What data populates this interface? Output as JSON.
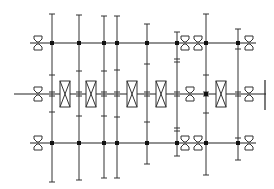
{
  "diagram": {
    "type": "gear-transmission-schematic",
    "stroke_color": "#333333",
    "background": "#ffffff",
    "shafts": [
      {
        "id": "top-shaft",
        "y": 43,
        "x1": 30,
        "x2": 256
      },
      {
        "id": "middle-shaft",
        "y": 94,
        "x1": 14,
        "x2": 266
      },
      {
        "id": "bottom-shaft",
        "y": 143,
        "x1": 30,
        "x2": 256
      }
    ],
    "output_bar": {
      "x": 265,
      "y1": 80,
      "y2": 110
    },
    "gears": [
      {
        "x": 52,
        "y1": 14,
        "y2": 182,
        "ticks": [
          75,
          112
        ]
      },
      {
        "x": 79,
        "y1": 15,
        "y2": 180,
        "ticks": [
          71,
          116
        ]
      },
      {
        "x": 104,
        "y1": 16,
        "y2": 178,
        "ticks": [
          71,
          116
        ]
      },
      {
        "x": 117,
        "y1": 16,
        "y2": 178,
        "ticks": [
          70,
          117
        ]
      },
      {
        "x": 147,
        "y1": 24,
        "y2": 164,
        "ticks": [
          64,
          122
        ]
      },
      {
        "x": 177,
        "y1": 32,
        "y2": 156,
        "ticks": [
          59,
          62,
          128,
          131
        ]
      },
      {
        "x": 206,
        "y1": 14,
        "y2": 175,
        "ticks": [
          75,
          113
        ]
      },
      {
        "x": 238,
        "y1": 29,
        "y2": 160,
        "ticks": [
          49,
          138
        ]
      }
    ],
    "nodes": [
      {
        "x": 52,
        "y": 43
      },
      {
        "x": 79,
        "y": 43
      },
      {
        "x": 104,
        "y": 43
      },
      {
        "x": 117,
        "y": 43
      },
      {
        "x": 147,
        "y": 43
      },
      {
        "x": 177,
        "y": 43
      },
      {
        "x": 206,
        "y": 43
      },
      {
        "x": 238,
        "y": 43
      },
      {
        "x": 206,
        "y": 94
      },
      {
        "x": 52,
        "y": 143
      },
      {
        "x": 79,
        "y": 143
      },
      {
        "x": 104,
        "y": 143
      },
      {
        "x": 117,
        "y": 143
      },
      {
        "x": 147,
        "y": 143
      },
      {
        "x": 177,
        "y": 143
      },
      {
        "x": 206,
        "y": 143
      },
      {
        "x": 238,
        "y": 143
      }
    ],
    "clutches": [
      {
        "x": 60,
        "y": 81,
        "w": 10,
        "h": 26
      },
      {
        "x": 86,
        "y": 81,
        "w": 10,
        "h": 26
      },
      {
        "x": 127,
        "y": 81,
        "w": 10,
        "h": 26
      },
      {
        "x": 156,
        "y": 81,
        "w": 10,
        "h": 26
      },
      {
        "x": 216,
        "y": 81,
        "w": 10,
        "h": 26
      }
    ],
    "bearings": [
      {
        "x": 38,
        "y": 43
      },
      {
        "x": 185,
        "y": 43
      },
      {
        "x": 198,
        "y": 43
      },
      {
        "x": 249,
        "y": 43
      },
      {
        "x": 38,
        "y": 94
      },
      {
        "x": 190,
        "y": 94
      },
      {
        "x": 249,
        "y": 94
      },
      {
        "x": 38,
        "y": 143
      },
      {
        "x": 185,
        "y": 143
      },
      {
        "x": 198,
        "y": 143
      },
      {
        "x": 249,
        "y": 143
      }
    ]
  }
}
